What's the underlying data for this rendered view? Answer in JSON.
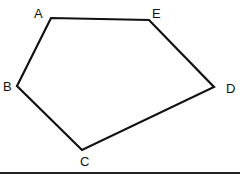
{
  "figure": {
    "type": "pentagon",
    "stroke_color": "#111111",
    "background": "#ffffff",
    "vertices": [
      {
        "label": "A",
        "x": 51,
        "y": 18,
        "lx": 34,
        "ly": 18
      },
      {
        "label": "E",
        "x": 149,
        "y": 20,
        "lx": 152,
        "ly": 18
      },
      {
        "label": "D",
        "x": 214,
        "y": 87,
        "lx": 226,
        "ly": 93
      },
      {
        "label": "C",
        "x": 82,
        "y": 150,
        "lx": 80,
        "ly": 166
      },
      {
        "label": "B",
        "x": 17,
        "y": 86,
        "lx": 3,
        "ly": 91
      }
    ],
    "baseline": {
      "x1": 0,
      "y1": 173,
      "x2": 240,
      "y2": 173
    }
  }
}
